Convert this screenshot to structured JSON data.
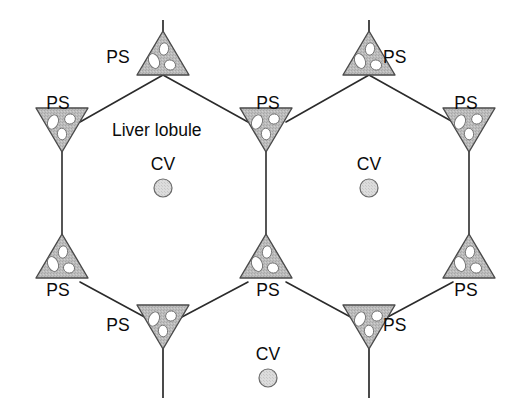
{
  "figure": {
    "background_color": "#ffffff",
    "line_color": "#2b2b2b",
    "triangle_fill_color": "#b9b9b9",
    "triangle_stroke_color": "#4a4a4a",
    "hole_fill_color": "#ffffff",
    "circle_fill_color": "#d7d7d7",
    "circle_stroke_color": "#6a6a6a",
    "text_color": "#0b0b0b"
  },
  "labels": {
    "lobule": "Liver lobule",
    "portal_space": "PS",
    "central_vein": "CV"
  },
  "lobule_label": {
    "text": "Liver lobule",
    "x": 112,
    "y": 136
  },
  "central_veins": [
    {
      "id": "cv-left-lobule",
      "label": "CV",
      "cx": 163,
      "cy": 188,
      "r": 9,
      "label_x": 163,
      "label_y": 170
    },
    {
      "id": "cv-right-lobule",
      "label": "CV",
      "cx": 369,
      "cy": 188,
      "r": 9,
      "label_x": 369,
      "label_y": 170
    },
    {
      "id": "cv-bottom-lobule",
      "label": "CV",
      "cx": 268,
      "cy": 378,
      "r": 9,
      "label_x": 268,
      "label_y": 360
    }
  ],
  "portal_spaces": [
    {
      "id": "ps-top-left",
      "label": "PS",
      "orientation": "up",
      "label_x": 130,
      "label_y": 63,
      "label_anchor": "end"
    },
    {
      "id": "ps-top-right",
      "label": "PS",
      "orientation": "up",
      "label_x": 383,
      "label_y": 63,
      "label_anchor": "start"
    },
    {
      "id": "ps-left-upper",
      "label": "PS",
      "orientation": "down",
      "label_x": 58,
      "label_y": 109,
      "label_anchor": "middle"
    },
    {
      "id": "ps-middle-upper",
      "label": "PS",
      "orientation": "down",
      "label_x": 268,
      "label_y": 109,
      "label_anchor": "middle"
    },
    {
      "id": "ps-right-upper",
      "label": "PS",
      "orientation": "down",
      "label_x": 466,
      "label_y": 109,
      "label_anchor": "middle"
    },
    {
      "id": "ps-left-lower",
      "label": "PS",
      "orientation": "up",
      "label_x": 58,
      "label_y": 296,
      "label_anchor": "middle"
    },
    {
      "id": "ps-middle-lower",
      "label": "PS",
      "orientation": "up",
      "label_x": 268,
      "label_y": 296,
      "label_anchor": "middle"
    },
    {
      "id": "ps-right-lower",
      "label": "PS",
      "orientation": "up",
      "label_x": 466,
      "label_y": 296,
      "label_anchor": "middle"
    },
    {
      "id": "ps-bottom-left",
      "label": "PS",
      "orientation": "down",
      "label_x": 130,
      "label_y": 331,
      "label_anchor": "end"
    },
    {
      "id": "ps-bottom-right",
      "label": "PS",
      "orientation": "down",
      "label_x": 383,
      "label_y": 331,
      "label_anchor": "start"
    }
  ],
  "counts": {
    "portal_spaces_visible": 10,
    "central_veins_visible": 3,
    "lobules_drawn": 2
  }
}
